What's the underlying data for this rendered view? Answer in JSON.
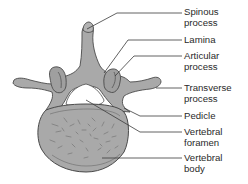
{
  "colors": {
    "bone_fill": "#a9a9a9",
    "bone_outline": "#4a4a4a",
    "leader_line": "#3a3a3a",
    "text": "#2a2a2a",
    "background": "#ffffff"
  },
  "labels": [
    {
      "id": "spinous-process",
      "text": "Spinous\nprocess",
      "top": 7
    },
    {
      "id": "lamina",
      "text": "Lamina",
      "top": 35
    },
    {
      "id": "articular-process",
      "text": "Articular\nprocess",
      "top": 51
    },
    {
      "id": "transverse-process",
      "text": "Transverse\nprocess",
      "top": 83
    },
    {
      "id": "pedicle",
      "text": "Pedicle",
      "top": 111
    },
    {
      "id": "vertebral-foramen",
      "text": "Vertebral\nforamen",
      "top": 127
    },
    {
      "id": "vertebral-body",
      "text": "Vertebral\nbody",
      "top": 153
    }
  ]
}
